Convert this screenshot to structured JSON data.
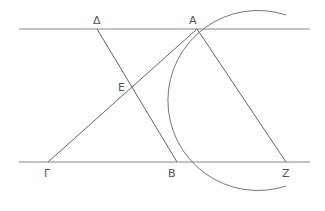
{
  "diagram": {
    "type": "geometry",
    "stroke_color": "#666666",
    "parallel_lines": {
      "top": {
        "x1": 19,
        "x2": 310,
        "y": 29
      },
      "bottom": {
        "x1": 19,
        "x2": 310,
        "y": 162
      }
    },
    "points": {
      "Delta": {
        "label": "Δ",
        "x": 97,
        "y": 29
      },
      "A": {
        "label": "A",
        "x": 197,
        "y": 29
      },
      "E": {
        "label": "E",
        "x": 132,
        "y": 92
      },
      "Gamma": {
        "label": "Γ",
        "x": 48,
        "y": 162
      },
      "B": {
        "label": "B",
        "x": 177,
        "y": 162
      },
      "Z": {
        "label": "Z",
        "x": 286,
        "y": 162
      }
    },
    "segments": [
      {
        "from": "Delta",
        "to": "B"
      },
      {
        "from": "Gamma",
        "to": "A"
      },
      {
        "from": "A",
        "to": "Z"
      }
    ],
    "arc": {
      "cx": 250,
      "cy": 100,
      "r": 90,
      "description": "circular arc through A and B, opening to the right"
    }
  }
}
